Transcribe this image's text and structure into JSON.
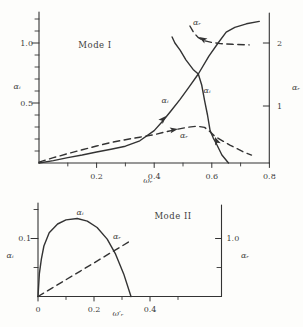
{
  "figure": {
    "background": "#fdfdfb",
    "ink": "#333333"
  },
  "chart_data": [
    {
      "type": "line",
      "title": "Mode I",
      "xlabel": "ωᵣ",
      "ylabel_left": "αᵢ",
      "ylabel_right": "αᵣ",
      "x_range": [
        0,
        0.8
      ],
      "y_left_range": [
        0,
        1.25
      ],
      "y_right_range": [
        0,
        2.4
      ],
      "grid": false,
      "x_ticks": [
        {
          "v": 0.2,
          "label": "0.2"
        },
        {
          "v": 0.4,
          "label": "0.4"
        },
        {
          "v": 0.6,
          "label": "0.6"
        },
        {
          "v": 0.8,
          "label": "0.8"
        }
      ],
      "x_minor_ticks": [
        0.1,
        0.3,
        0.5,
        0.7
      ],
      "y_left_ticks": [
        {
          "v": 0.5,
          "label": "0.5"
        },
        {
          "v": 1.0,
          "label": "1.0"
        }
      ],
      "y_left_minor_ticks": [
        0.1,
        0.2,
        0.3,
        0.4,
        0.6,
        0.7,
        0.8,
        0.9,
        1.1,
        1.2
      ],
      "y_right_ticks": [
        {
          "v": 1,
          "label": "1"
        },
        {
          "v": 2,
          "label": "2"
        }
      ],
      "y_right_minor_ticks": [],
      "series": [
        {
          "name": "alpha-i-lower-branch",
          "label": "αᵢ",
          "axis": "left",
          "style": "solid",
          "points": [
            [
              0,
              0
            ],
            [
              0.05,
              0.02
            ],
            [
              0.1,
              0.045
            ],
            [
              0.15,
              0.067
            ],
            [
              0.2,
              0.092
            ],
            [
              0.25,
              0.115
            ],
            [
              0.3,
              0.14
            ],
            [
              0.35,
              0.185
            ],
            [
              0.4,
              0.27
            ],
            [
              0.43,
              0.35
            ],
            [
              0.46,
              0.44
            ],
            [
              0.49,
              0.53
            ],
            [
              0.52,
              0.63
            ],
            [
              0.553,
              0.742
            ],
            [
              0.59,
              0.89
            ],
            [
              0.622,
              1.0
            ],
            [
              0.65,
              1.09
            ],
            [
              0.68,
              1.13
            ],
            [
              0.72,
              1.16
            ],
            [
              0.765,
              1.18
            ]
          ]
        },
        {
          "name": "alpha-i-upper-branch",
          "label": "αᵢ",
          "axis": "left",
          "style": "solid",
          "points": [
            [
              0.462,
              1.05
            ],
            [
              0.472,
              1.0
            ],
            [
              0.49,
              0.94
            ],
            [
              0.51,
              0.86
            ],
            [
              0.535,
              0.78
            ],
            [
              0.553,
              0.742
            ],
            [
              0.565,
              0.65
            ],
            [
              0.575,
              0.52
            ],
            [
              0.585,
              0.4
            ],
            [
              0.594,
              0.27
            ],
            [
              0.605,
              0.21
            ],
            [
              0.618,
              0.15
            ],
            [
              0.635,
              0.067
            ],
            [
              0.658,
              0
            ]
          ]
        },
        {
          "name": "alpha-r-lower-branch",
          "label": "αᵣ",
          "axis": "right",
          "style": "dashed",
          "points": [
            [
              0,
              0.11
            ],
            [
              0.05,
              0.18
            ],
            [
              0.1,
              0.245
            ],
            [
              0.15,
              0.305
            ],
            [
              0.2,
              0.365
            ],
            [
              0.25,
              0.42
            ],
            [
              0.3,
              0.465
            ],
            [
              0.35,
              0.505
            ],
            [
              0.4,
              0.545
            ],
            [
              0.44,
              0.59
            ],
            [
              0.48,
              0.63
            ],
            [
              0.52,
              0.665
            ],
            [
              0.55,
              0.68
            ],
            [
              0.575,
              0.66
            ],
            [
              0.594,
              0.59
            ],
            [
              0.61,
              0.52
            ],
            [
              0.64,
              0.44
            ],
            [
              0.663,
              0.38
            ],
            [
              0.71,
              0.27
            ],
            [
              0.738,
              0.22
            ]
          ]
        },
        {
          "name": "alpha-r-upper-branch",
          "label": "αᵣ",
          "axis": "right",
          "style": "dashed",
          "points": [
            [
              0.524,
              2.27
            ],
            [
              0.538,
              2.16
            ],
            [
              0.552,
              2.09
            ],
            [
              0.57,
              2.04
            ],
            [
              0.6,
              2.01
            ],
            [
              0.63,
              1.99
            ],
            [
              0.672,
              1.98
            ],
            [
              0.73,
              1.97
            ]
          ]
        }
      ],
      "annotations": [
        {
          "text": "αᵣ",
          "x": 197,
          "y": 22
        },
        {
          "text": "αᵢ",
          "x": 165,
          "y": 100
        },
        {
          "text": "αᵢ",
          "x": 207,
          "y": 90
        },
        {
          "text": "αᵣ",
          "x": 184,
          "y": 135
        }
      ],
      "arrows": [
        {
          "x": 166,
          "y": 116,
          "angle": -47
        },
        {
          "x": 178,
          "y": 129,
          "angle": -10
        },
        {
          "x": 199,
          "y": 37,
          "angle": -150
        },
        {
          "x": 215,
          "y": 137,
          "angle": -112
        }
      ]
    },
    {
      "type": "line",
      "title": "Mode II",
      "xlabel": "ω′ᵣ",
      "ylabel_left": "αᵢ",
      "ylabel_right": "αᵣ",
      "x_range": [
        0,
        0.65
      ],
      "y_left_range": [
        0,
        0.16
      ],
      "y_right_range": [
        0,
        1.6
      ],
      "grid": false,
      "x_ticks": [
        {
          "v": 0,
          "label": "0"
        },
        {
          "v": 0.2,
          "label": "0.2"
        },
        {
          "v": 0.4,
          "label": "0.4"
        }
      ],
      "x_minor_ticks": [
        0.1,
        0.3,
        0.5
      ],
      "y_left_ticks": [
        {
          "v": 0.1,
          "label": "0.1"
        }
      ],
      "y_left_minor_ticks": [
        0.05,
        0.15
      ],
      "y_right_ticks": [
        {
          "v": 1.0,
          "label": "1.0"
        }
      ],
      "y_right_minor_ticks": [
        0.5
      ],
      "series": [
        {
          "name": "alpha-i-mode2",
          "label": "αᵢ",
          "axis": "left",
          "style": "solid",
          "points": [
            [
              0,
              0
            ],
            [
              0.005,
              0.04
            ],
            [
              0.012,
              0.065
            ],
            [
              0.021,
              0.087
            ],
            [
              0.04,
              0.11
            ],
            [
              0.07,
              0.125
            ],
            [
              0.1,
              0.132
            ],
            [
              0.14,
              0.1345
            ],
            [
              0.176,
              0.13
            ],
            [
              0.211,
              0.119
            ],
            [
              0.247,
              0.099
            ],
            [
              0.277,
              0.073
            ],
            [
              0.306,
              0.039
            ],
            [
              0.332,
              0
            ]
          ]
        },
        {
          "name": "alpha-r-mode2",
          "label": "αᵣ",
          "axis": "right",
          "style": "dashed",
          "points": [
            [
              0,
              0
            ],
            [
              0.05,
              0.145
            ],
            [
              0.1,
              0.29
            ],
            [
              0.15,
              0.435
            ],
            [
              0.2,
              0.58
            ],
            [
              0.25,
              0.725
            ],
            [
              0.3,
              0.87
            ],
            [
              0.325,
              0.945
            ]
          ]
        }
      ],
      "annotations": [
        {
          "text": "αᵢ",
          "x": 80,
          "y": 212
        },
        {
          "text": "αᵣ",
          "x": 117,
          "y": 236
        }
      ],
      "arrows": []
    }
  ]
}
